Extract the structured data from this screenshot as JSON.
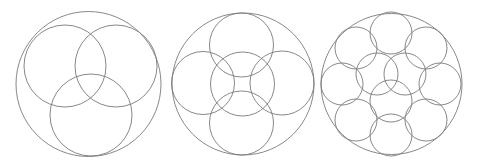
{
  "canvas": {
    "width": 477,
    "height": 165,
    "background": "#ffffff",
    "stroke": "#7a7a7a"
  },
  "diagrams": [
    {
      "name": "three-circles-packing",
      "outer": {
        "cx": 88.5,
        "cy": 84,
        "r": 72.5
      },
      "inner": [
        {
          "cx": 65,
          "cy": 66,
          "r": 41
        },
        {
          "cx": 116,
          "cy": 66,
          "r": 41
        },
        {
          "cx": 91,
          "cy": 115,
          "r": 41
        }
      ]
    },
    {
      "name": "five-circles-packing",
      "outer": {
        "cx": 243,
        "cy": 84,
        "r": 71
      },
      "inner": [
        {
          "cx": 241.5,
          "cy": 45,
          "r": 32
        },
        {
          "cx": 203,
          "cy": 83,
          "r": 31.5
        },
        {
          "cx": 242.5,
          "cy": 84,
          "r": 32
        },
        {
          "cx": 282,
          "cy": 83,
          "r": 32
        },
        {
          "cx": 241.5,
          "cy": 123,
          "r": 32
        }
      ]
    },
    {
      "name": "eleven-circles-packing",
      "outer": {
        "cx": 391.5,
        "cy": 84,
        "r": 70.5
      },
      "inner": [
        {
          "cx": 391,
          "cy": 33,
          "r": 21
        },
        {
          "cx": 356,
          "cy": 48,
          "r": 21
        },
        {
          "cx": 426,
          "cy": 48,
          "r": 21
        },
        {
          "cx": 342,
          "cy": 84,
          "r": 21
        },
        {
          "cx": 440,
          "cy": 84,
          "r": 21
        },
        {
          "cx": 356,
          "cy": 120,
          "r": 21
        },
        {
          "cx": 426,
          "cy": 120,
          "r": 21
        },
        {
          "cx": 391,
          "cy": 135,
          "r": 21
        },
        {
          "cx": 377,
          "cy": 74,
          "r": 21
        },
        {
          "cx": 405,
          "cy": 74,
          "r": 21
        },
        {
          "cx": 391,
          "cy": 101,
          "r": 21
        }
      ]
    }
  ]
}
